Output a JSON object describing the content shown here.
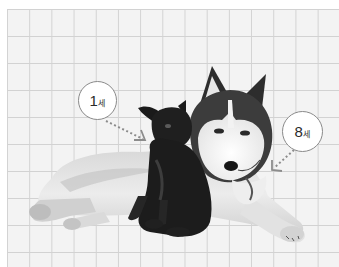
{
  "scene": {
    "description": "Grayscale photo of a Siberian husky lying down next to a small black puppy on a grid-paper background",
    "background": {
      "paper_color": "#f3f3f3",
      "grid_line_color": "#d2d2d2",
      "margin_color": "#ffffff"
    }
  },
  "callouts": [
    {
      "id": "small-dog-age",
      "number": "1",
      "unit": "세",
      "points_to": "small black dog"
    },
    {
      "id": "husky-age",
      "number": "8",
      "unit": "세",
      "points_to": "husky"
    }
  ],
  "colors": {
    "bubble_fill": "#ffffff",
    "bubble_border": "#8a8a8a",
    "arrow": "#8c8c8c",
    "husky_dark": "#3a3a3a",
    "husky_light": "#ececec",
    "puppy": "#1c1c1c"
  }
}
